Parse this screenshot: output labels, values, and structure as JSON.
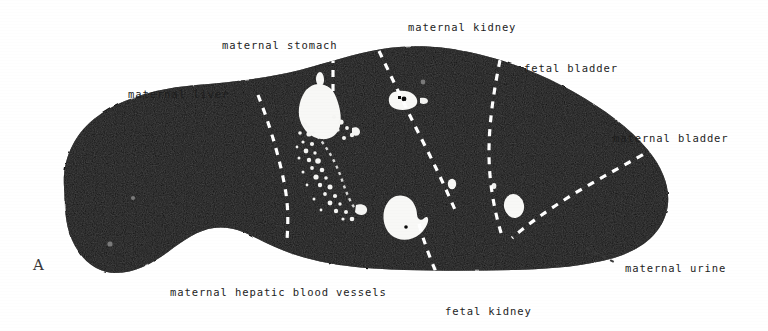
{
  "figure": {
    "panel_letter": "A",
    "background_color": "#ffffff",
    "tissue_color": "#0b0b0b",
    "structure_color": "#ffffff",
    "label_color": "#1d1d1d",
    "divider_style": "white-dashed"
  },
  "labels": [
    {
      "id": "maternal-kidney",
      "text": "maternal kidney",
      "x": 408,
      "y": 22
    },
    {
      "id": "maternal-stomach",
      "text": "maternal stomach",
      "x": 222,
      "y": 40
    },
    {
      "id": "fetal-bladder",
      "text": "fetal bladder",
      "x": 524,
      "y": 63
    },
    {
      "id": "maternal-liver",
      "text": "maternal liver",
      "x": 128,
      "y": 89
    },
    {
      "id": "maternal-bladder",
      "text": "maternal bladder",
      "x": 613,
      "y": 133
    },
    {
      "id": "maternal-urine",
      "text": "maternal urine",
      "x": 625,
      "y": 263
    },
    {
      "id": "maternal-hepatic-blood-vessels",
      "text": "maternal hepatic blood vessels",
      "x": 170,
      "y": 287
    },
    {
      "id": "fetal-kidney",
      "text": "fetal kidney",
      "x": 445,
      "y": 306
    }
  ],
  "anatomy": {
    "outline_name": "maternal-abdomen-cross-section",
    "regions": [
      "maternal liver",
      "maternal stomach",
      "maternal kidney",
      "maternal hepatic blood vessels",
      "fetal bladder",
      "fetal kidney",
      "maternal bladder",
      "maternal urine"
    ],
    "bright_structures": [
      {
        "name": "maternal-stomach-lumen",
        "cx": 325,
        "cy": 110
      },
      {
        "name": "maternal-kidney-pelvis",
        "cx": 404,
        "cy": 100
      },
      {
        "name": "fetal-kidney-structure",
        "cx": 403,
        "cy": 219
      },
      {
        "name": "maternal-bladder-urine",
        "cx": 515,
        "cy": 206
      },
      {
        "name": "hepatic-vessel-speckle",
        "cx": 330,
        "cy": 165
      }
    ]
  }
}
